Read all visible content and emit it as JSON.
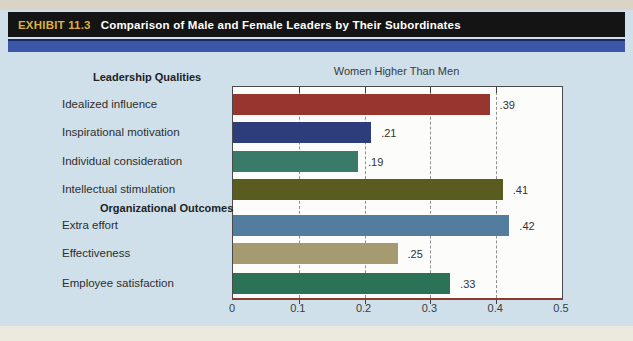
{
  "header": {
    "exhibit_label": "EXHIBIT 11.3",
    "title": "Comparison of Male and Female Leaders by Their Subordinates"
  },
  "chart_data": {
    "type": "bar",
    "orientation": "horizontal",
    "title": "Women Higher Than Men",
    "xlabel": "",
    "ylabel": "",
    "xlim": [
      0,
      0.5
    ],
    "xtick_labels": [
      "0",
      "0.1",
      "0.2",
      "0.3",
      "0.4",
      "0.5"
    ],
    "grid": "dashed-vertical",
    "legend": "none",
    "groups": [
      {
        "heading": "Leadership Qualities",
        "items": [
          {
            "label": "Idealized influence",
            "value": 0.39,
            "value_label": ".39",
            "color": "#97362e"
          },
          {
            "label": "Inspirational motivation",
            "value": 0.21,
            "value_label": ".21",
            "color": "#2d3d7c"
          },
          {
            "label": "Individual consideration",
            "value": 0.19,
            "value_label": ".19",
            "color": "#3a7a68"
          },
          {
            "label": "Intellectual stimulation",
            "value": 0.41,
            "value_label": ".41",
            "color": "#5a5c1f"
          }
        ]
      },
      {
        "heading": "Organizational Outcomes",
        "items": [
          {
            "label": "Extra effort",
            "value": 0.42,
            "value_label": ".42",
            "color": "#527d9e"
          },
          {
            "label": "Effectiveness",
            "value": 0.25,
            "value_label": ".25",
            "color": "#a69b70"
          },
          {
            "label": "Employee satisfaction",
            "value": 0.33,
            "value_label": ".33",
            "color": "#2c7257"
          }
        ]
      }
    ]
  },
  "colors": {
    "page_background": "#cfe0ea",
    "header_bar": "#141414",
    "exhibit_label": "#dcb13e",
    "header_text": "#ffffff",
    "accent_stripe": "#3c57a8",
    "plot_background": "#fcfcfa",
    "axis_line": "#8a3c32",
    "gridline": "#8f8f8f"
  }
}
